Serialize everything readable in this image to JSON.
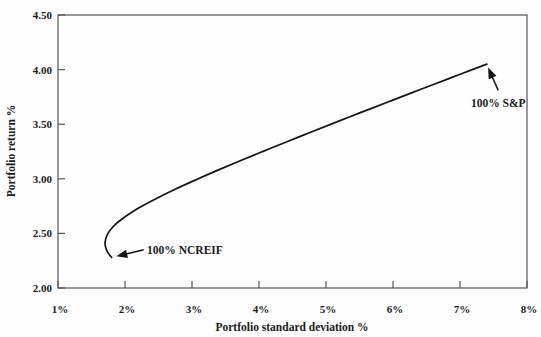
{
  "figure": {
    "background": "#fdfdfd",
    "frame_color": "#565656",
    "line_color": "#141414",
    "text_color": "#1b1b1b"
  },
  "chart_data": {
    "type": "line",
    "title": "",
    "xlabel": "Portfolio standard deviation %",
    "ylabel": "Portfolio return %",
    "xlim": [
      1,
      8
    ],
    "ylim": [
      2.0,
      4.5
    ],
    "x_tick_values": [
      1,
      2,
      3,
      4,
      5,
      6,
      7,
      8
    ],
    "x_tick_labels": [
      "1%",
      "2%",
      "3%",
      "4%",
      "5%",
      "6%",
      "7%",
      "8%"
    ],
    "y_tick_values": [
      2.0,
      2.5,
      3.0,
      3.5,
      4.0,
      4.5
    ],
    "y_tick_labels": [
      "2.00",
      "2.50",
      "3.00",
      "3.50",
      "4.00",
      "4.50"
    ],
    "grid": false,
    "frame": "box",
    "legend": "none",
    "series": [
      {
        "name": "efficient-frontier",
        "points": [
          [
            1.8,
            2.28
          ],
          [
            1.755,
            2.315
          ],
          [
            1.724,
            2.351
          ],
          [
            1.702,
            2.413
          ],
          [
            1.737,
            2.492
          ],
          [
            1.825,
            2.563
          ],
          [
            1.959,
            2.634
          ],
          [
            2.178,
            2.723
          ],
          [
            2.441,
            2.811
          ],
          [
            2.733,
            2.9
          ],
          [
            3.048,
            2.988
          ],
          [
            3.378,
            3.077
          ],
          [
            3.719,
            3.165
          ],
          [
            4.07,
            3.254
          ],
          [
            4.426,
            3.342
          ],
          [
            4.788,
            3.431
          ],
          [
            5.154,
            3.519
          ],
          [
            5.523,
            3.608
          ],
          [
            5.895,
            3.696
          ],
          [
            6.267,
            3.785
          ],
          [
            6.644,
            3.873
          ],
          [
            7.022,
            3.962
          ],
          [
            7.4,
            4.05
          ]
        ]
      }
    ],
    "annotations": [
      {
        "label": "100% S&P",
        "arrow_from": [
          7.57,
          3.81
        ],
        "arrow_to": [
          7.42,
          4.02
        ],
        "text_pos": [
          7.57,
          3.69
        ],
        "text_anchor": "middle"
      },
      {
        "label": "100% NCREIF",
        "arrow_from": [
          2.28,
          2.35
        ],
        "arrow_to": [
          1.87,
          2.29
        ],
        "text_pos": [
          2.33,
          2.35
        ],
        "text_anchor": "start"
      }
    ]
  }
}
